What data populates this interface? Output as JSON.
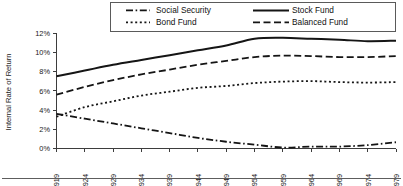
{
  "chart_data": {
    "type": "line",
    "title": "",
    "xlabel": "",
    "ylabel": "Internal Rate of Return",
    "xlim": [
      1919,
      1979
    ],
    "ylim": [
      0,
      12
    ],
    "grid": false,
    "legend_position": "top",
    "x_tick_labels": [
      "1919",
      "1924",
      "1929",
      "1934",
      "1939",
      "1944",
      "1949",
      "1954",
      "1959",
      "1964",
      "1969",
      "1974",
      "1979"
    ],
    "y_tick_labels": [
      "0%",
      "2%",
      "4%",
      "6%",
      "8%",
      "10%",
      "12%"
    ],
    "x": [
      1919,
      1924,
      1929,
      1934,
      1939,
      1944,
      1949,
      1954,
      1959,
      1964,
      1969,
      1974,
      1979
    ],
    "series": [
      {
        "name": "Social Security",
        "style": "dash-dot",
        "values": [
          3.6,
          3.1,
          2.6,
          2.1,
          1.6,
          1.1,
          0.7,
          0.4,
          0.1,
          0.2,
          0.2,
          0.35,
          0.65
        ]
      },
      {
        "name": "Stock Fund",
        "style": "solid",
        "values": [
          7.5,
          8.1,
          8.7,
          9.2,
          9.7,
          10.2,
          10.7,
          11.4,
          11.5,
          11.4,
          11.3,
          11.15,
          11.2
        ]
      },
      {
        "name": "Bond Fund",
        "style": "dotted",
        "values": [
          3.3,
          4.3,
          4.9,
          5.5,
          5.9,
          6.3,
          6.5,
          6.8,
          6.95,
          7.0,
          6.9,
          6.85,
          6.9
        ]
      },
      {
        "name": "Balanced Fund",
        "style": "dashed",
        "values": [
          5.6,
          6.4,
          7.1,
          7.7,
          8.2,
          8.7,
          9.1,
          9.5,
          9.65,
          9.6,
          9.5,
          9.5,
          9.6
        ]
      }
    ]
  },
  "legend": {
    "entries": [
      {
        "label": "Social Security",
        "style": "dash-dot"
      },
      {
        "label": "Stock Fund",
        "style": "solid"
      },
      {
        "label": "Bond Fund",
        "style": "dotted"
      },
      {
        "label": "Balanced Fund",
        "style": "dashed"
      }
    ]
  },
  "colors": {
    "line": "#151515",
    "axis": "#3d3d3d",
    "text": "#1a1a1a",
    "background": "#ffffff"
  }
}
